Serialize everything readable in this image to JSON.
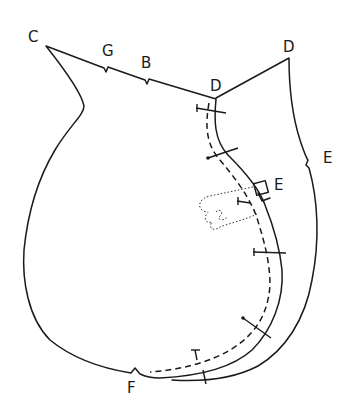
{
  "diagram": {
    "labels": {
      "c": "C",
      "g": "G",
      "b": "B",
      "d_left": "D",
      "d_right": "D",
      "e_outer": "E",
      "e_inner": "E",
      "f": "F",
      "t_bottom": "T"
    },
    "colors": {
      "line": "#1a1a1a",
      "background": "#ffffff"
    },
    "pin_count": 7
  }
}
